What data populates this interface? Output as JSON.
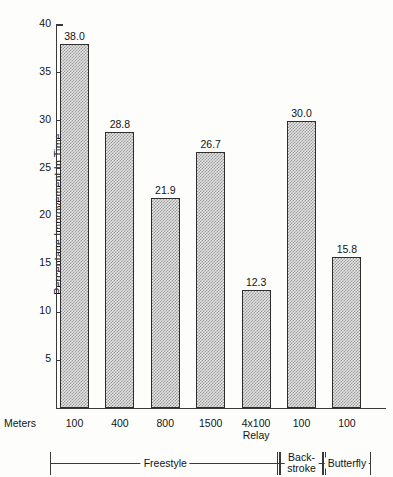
{
  "chart_data": {
    "type": "bar",
    "title": "",
    "xlabel": "Meters",
    "ylabel": "Percentage Improvement In Time",
    "categories": [
      "100",
      "400",
      "800",
      "1500",
      "4x100 Relay",
      "100",
      "100"
    ],
    "values": [
      38.0,
      28.8,
      21.9,
      26.7,
      12.3,
      30.0,
      15.8
    ],
    "value_labels": [
      "38.0",
      "28.8",
      "21.9",
      "26.7",
      "12.3",
      "30.0",
      "15.8"
    ],
    "ylim": [
      0,
      40
    ],
    "yticks": [
      5,
      10,
      15,
      20,
      25,
      30,
      35,
      40
    ],
    "ytick_labels": [
      "5",
      "10",
      "15",
      "20",
      "25",
      "30",
      "35",
      "40"
    ],
    "grid": false,
    "legend": "none",
    "groups": [
      {
        "name": "Freestyle",
        "first_index": 0,
        "last_index": 4,
        "two_line": false
      },
      {
        "name": "Back-stroke",
        "first_index": 5,
        "last_index": 5,
        "two_line": true,
        "line1": "Back-",
        "line2": "stroke"
      },
      {
        "name": "Butterfly",
        "first_index": 6,
        "last_index": 6,
        "two_line": false
      }
    ],
    "bar_fill_color": "#e3e3e3",
    "bar_edge_color": "#2e2e2e",
    "axis_color": "#3a3a3a"
  },
  "axis": {
    "y_label": "Percentage Improvement In Time",
    "meters_label": "Meters"
  },
  "categories": [
    {
      "line1": "100",
      "line2": ""
    },
    {
      "line1": "400",
      "line2": ""
    },
    {
      "line1": "800",
      "line2": ""
    },
    {
      "line1": "1500",
      "line2": ""
    },
    {
      "line1": "4x100",
      "line2": "Relay"
    },
    {
      "line1": "100",
      "line2": ""
    },
    {
      "line1": "100",
      "line2": ""
    }
  ],
  "groups": [
    {
      "label": "Freestyle",
      "line1": "Freestyle",
      "line2": ""
    },
    {
      "label": "Back-stroke",
      "line1": "Back-",
      "line2": "stroke"
    },
    {
      "label": "Butterfly",
      "line1": "Butterfly",
      "line2": ""
    }
  ]
}
